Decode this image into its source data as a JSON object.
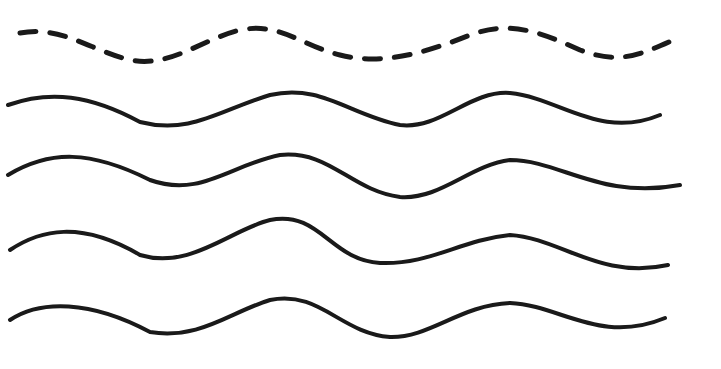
{
  "canvas": {
    "width": 721,
    "height": 369,
    "background": "#ffffff",
    "stroke": "#1a1a1a"
  },
  "waves": [
    {
      "style": "dashed",
      "path": "M20,33 C60,25 90,50 130,60 C170,68 200,40 240,30 C280,22 300,45 340,55 C380,65 420,55 470,35 C510,20 540,32 580,50 C620,65 640,55 680,37"
    },
    {
      "style": "solid",
      "path": "M8,105 C50,90 90,95 140,122 C190,135 220,110 270,95 C320,83 350,115 400,125 C440,130 470,90 510,93 C560,98 600,140 660,115"
    },
    {
      "style": "solid",
      "path": "M8,175 C50,150 90,150 150,180 C200,198 230,165 280,155 C330,150 350,190 400,197 C440,200 470,165 510,160 C560,160 600,200 680,185"
    },
    {
      "style": "solid",
      "path": "M10,250 C40,230 80,220 140,255 C190,270 230,230 270,220 C320,210 330,260 380,263 C430,265 460,240 510,235 C560,238 600,280 668,265"
    },
    {
      "style": "solid",
      "path": "M10,320 C40,300 90,300 150,332 C200,340 230,312 270,300 C320,290 340,333 390,337 C430,338 460,305 510,303 C560,305 600,345 665,318"
    }
  ]
}
